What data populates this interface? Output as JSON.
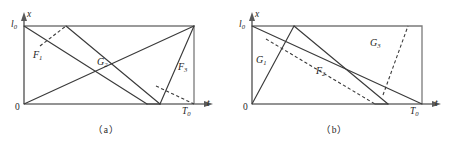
{
  "figure": {
    "panels": [
      {
        "id": "a",
        "caption": "（a）",
        "axes": {
          "x_axis_label": "t",
          "y_axis_label": "x",
          "origin_label": "0",
          "y_top_label": "l",
          "y_top_sub": "0",
          "x_end_label": "T",
          "x_end_sub": "0"
        },
        "regions": [
          {
            "name": "F",
            "sub": "1"
          },
          {
            "name": "G",
            "sub": "2"
          },
          {
            "name": "F",
            "sub": "3"
          }
        ]
      },
      {
        "id": "b",
        "caption": "（b）",
        "axes": {
          "x_axis_label": "t",
          "y_axis_label": "x",
          "origin_label": "0",
          "y_top_label": "l",
          "y_top_sub": "0",
          "x_end_label": "T",
          "x_end_sub": "0"
        },
        "regions": [
          {
            "name": "G",
            "sub": "1"
          },
          {
            "name": "F",
            "sub": "2"
          },
          {
            "name": "G",
            "sub": "3"
          }
        ]
      }
    ],
    "colors": {
      "axis": "#6f6f6f",
      "box": "#7a7a7a",
      "line": "#3a3a3a",
      "text": "#1d1d1d",
      "background": "#ffffff"
    }
  }
}
